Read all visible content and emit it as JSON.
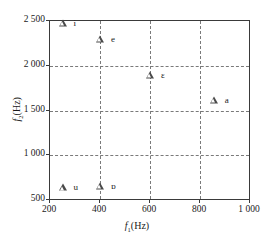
{
  "chart_data": {
    "type": "scatter",
    "title": "",
    "xlabel": "f1(Hz)",
    "ylabel": "f2(Hz)",
    "xlim": [
      200,
      1000
    ],
    "ylim": [
      500,
      2500
    ],
    "xticks": [
      "200",
      "400",
      "600",
      "800",
      "1 000"
    ],
    "xtick_values": [
      200,
      400,
      600,
      800,
      1000
    ],
    "yticks": [
      "500",
      "1 000",
      "1 500",
      "2 000",
      "2 500"
    ],
    "ytick_values": [
      500,
      1000,
      1500,
      2000,
      2500
    ],
    "grid": true,
    "grid_style": "dashed",
    "legend": "none",
    "marker": "triangle-open",
    "marker_color": "#4a4a4a",
    "series": [
      {
        "name": "vowels",
        "points": [
          {
            "label": "i",
            "x": 250,
            "y": 2475
          },
          {
            "label": "e",
            "x": 400,
            "y": 2300
          },
          {
            "label": "ɛ",
            "x": 600,
            "y": 1900
          },
          {
            "label": "a",
            "x": 855,
            "y": 1620
          },
          {
            "label": "u",
            "x": 250,
            "y": 640
          },
          {
            "label": "ɒ",
            "x": 400,
            "y": 660
          }
        ]
      }
    ]
  },
  "axes": {
    "x_title_symbol": "f",
    "x_title_sub": "1",
    "x_title_unit": "(Hz)",
    "y_title_symbol": "f",
    "y_title_sub": "2",
    "y_title_unit": "(Hz)"
  }
}
